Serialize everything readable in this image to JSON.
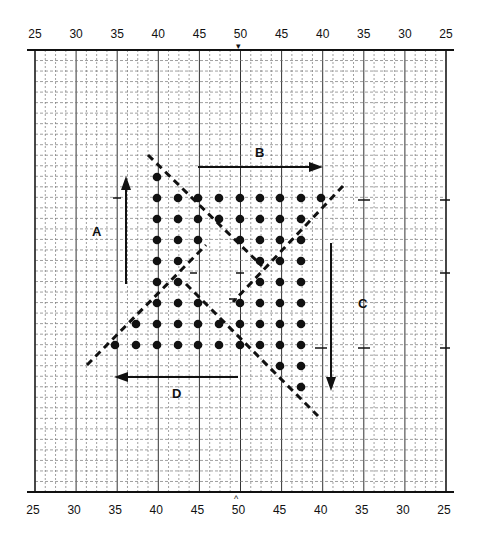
{
  "diagram": {
    "top_scale": [
      "25",
      "30",
      "35",
      "40",
      "45",
      "50",
      "45",
      "40",
      "35",
      "30",
      "25"
    ],
    "bottom_scale": [
      "25",
      "30",
      "35",
      "40",
      "45",
      "50",
      "45",
      "40",
      "35",
      "30",
      "25"
    ],
    "center_marker_top": "▾",
    "center_marker_bottom": "^",
    "arrows": [
      {
        "id": "A",
        "label": "A",
        "direction": "up"
      },
      {
        "id": "B",
        "label": "B",
        "direction": "right"
      },
      {
        "id": "C",
        "label": "C",
        "direction": "down"
      },
      {
        "id": "D",
        "label": "D",
        "direction": "left"
      }
    ],
    "dot_rows": [
      {
        "y": 177,
        "cols": [
          157
        ]
      },
      {
        "y": 198,
        "cols": [
          157,
          178,
          198,
          219,
          240,
          260,
          280,
          301,
          321
        ]
      },
      {
        "y": 219,
        "cols": [
          157,
          178,
          198,
          219,
          240,
          260,
          280,
          301
        ]
      },
      {
        "y": 240,
        "cols": [
          157,
          178,
          198,
          240,
          260,
          280,
          301
        ]
      },
      {
        "y": 261,
        "cols": [
          157,
          178,
          260,
          280,
          301
        ]
      },
      {
        "y": 282,
        "cols": [
          157,
          178,
          260,
          280,
          301
        ]
      },
      {
        "y": 303,
        "cols": [
          157,
          178,
          198,
          240,
          260,
          280,
          301
        ]
      },
      {
        "y": 324,
        "cols": [
          136,
          157,
          178,
          198,
          219,
          240,
          260,
          280,
          301
        ]
      },
      {
        "y": 345,
        "cols": [
          115,
          136,
          157,
          178,
          198,
          219,
          240,
          260,
          280,
          301
        ]
      },
      {
        "y": 366,
        "cols": [
          280,
          301
        ]
      },
      {
        "y": 387,
        "cols": [
          301
        ]
      }
    ],
    "colors": {
      "ink": "#111111",
      "grid": "#555555",
      "background": "#ffffff"
    }
  }
}
